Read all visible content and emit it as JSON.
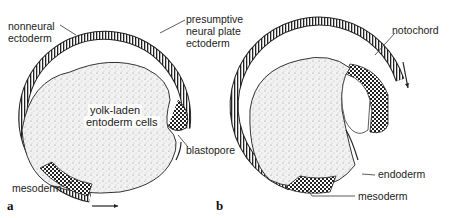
{
  "figure": {
    "panels": [
      {
        "id": "a",
        "label": "a",
        "annotations": {
          "nonneural_line1": "nonneural",
          "nonneural_line2": "ectoderm",
          "presumptive_line1": "presumptive",
          "presumptive_line2": "neural plate",
          "presumptive_line3": "ectoderm",
          "yolk_line1": "yolk-laden",
          "yolk_line2": "entoderm cells",
          "blastopore": "blastopore",
          "mesoderm": "mesoderm"
        }
      },
      {
        "id": "b",
        "label": "b",
        "annotations": {
          "notochord": "notochord",
          "endoderm": "endoderm",
          "mesoderm": "mesoderm"
        }
      }
    ]
  }
}
